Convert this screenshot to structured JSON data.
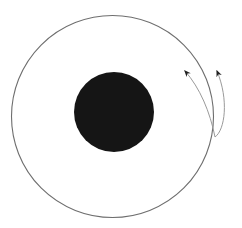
{
  "diagram": {
    "title": "",
    "colors": {
      "background": "#ffffff",
      "outer_circle_stroke": "#6e6e6e",
      "inner_disc_fill": "#151515",
      "arrow_stroke": "#9a9a9a",
      "arrowhead_fill": "#222222"
    },
    "elements": [
      {
        "id": "outer-circle",
        "shape": "circle",
        "cx": 112.5,
        "cy": 116.5,
        "r": 101
      },
      {
        "id": "inner-disc",
        "shape": "circle",
        "cx": 114,
        "cy": 112,
        "r": 40
      },
      {
        "id": "arrow-left",
        "shape": "curved-arrow",
        "from": [
          215,
          137
        ],
        "to": [
          184,
          70
        ]
      },
      {
        "id": "arrow-right",
        "shape": "curved-arrow",
        "from": [
          215,
          137
        ],
        "to": [
          216,
          70
        ]
      }
    ]
  }
}
